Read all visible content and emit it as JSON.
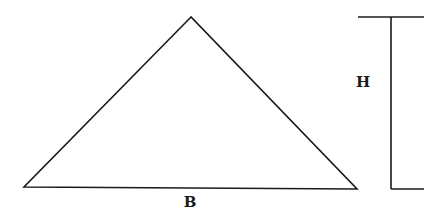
{
  "diagram": {
    "title": "",
    "shape": "triangle",
    "colors": {
      "stroke": "#1a1a1a",
      "background": "#ffffff"
    },
    "triangle": {
      "apex": [
        191,
        17
      ],
      "bottom_left": [
        24,
        187
      ],
      "bottom_right": [
        357,
        189
      ]
    },
    "height_marker": {
      "x": 391,
      "top_y": 17,
      "bottom_y": 189,
      "top_tick": [
        358,
        424
      ],
      "bottom_tick": [
        391,
        424
      ]
    },
    "labels": {
      "base": "B",
      "height": "H"
    },
    "label_positions": {
      "base": [
        190,
        202
      ],
      "height": [
        363,
        82
      ]
    }
  }
}
